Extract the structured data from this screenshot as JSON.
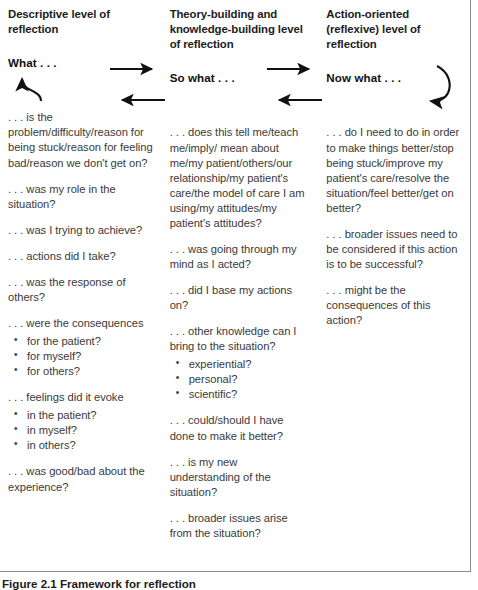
{
  "figure": {
    "caption_number": "Figure 2.1",
    "caption_text": "Framework for reflection",
    "columns": [
      {
        "id": "descriptive",
        "heading": "Descriptive level of reflection",
        "stem": "What . . .",
        "blocks": [
          {
            "type": "para",
            "text": ". . . is the problem/difficulty/reason for being stuck/reason for feeling bad/reason we don't get on?"
          },
          {
            "type": "para",
            "text": ". . . was my role in the situation?"
          },
          {
            "type": "para",
            "text": ". . . was I trying to achieve?"
          },
          {
            "type": "para",
            "text": ". . . actions did I take?"
          },
          {
            "type": "para",
            "text": ". . . was the response of others?"
          },
          {
            "type": "para-tight",
            "text": ". . . were the consequences"
          },
          {
            "type": "bullets",
            "items": [
              "for the patient?",
              "for myself?",
              "for others?"
            ]
          },
          {
            "type": "para-tight",
            "text": ". . . feelings did it evoke"
          },
          {
            "type": "bullets",
            "items": [
              "in the patient?",
              "in myself?",
              "in others?"
            ]
          },
          {
            "type": "para",
            "text": ". . . was good/bad about the experience?"
          }
        ]
      },
      {
        "id": "theory-building",
        "heading": "Theory-building and knowledge-building level of reflection",
        "stem": "So what . . .",
        "blocks": [
          {
            "type": "para",
            "text": ". . . does this tell me/teach me/imply/ mean about me/my patient/others/our relationship/my patient's care/the model of care I am using/my attitudes/my patient's attitudes?"
          },
          {
            "type": "para",
            "text": ". . . was going through my mind as I acted?"
          },
          {
            "type": "para",
            "text": ". . . did I base my actions on?"
          },
          {
            "type": "para-tight",
            "text": ". . . other knowledge can I bring to the situation?"
          },
          {
            "type": "bullets",
            "items": [
              "experiential?",
              "personal?",
              "scientific?"
            ]
          },
          {
            "type": "para",
            "text": ". . . could/should I have done to make it better?"
          },
          {
            "type": "para",
            "text": ". . . is my new understanding of the situation?"
          },
          {
            "type": "para",
            "text": ". . . broader issues arise from the situation?"
          }
        ]
      },
      {
        "id": "action-oriented",
        "heading": "Action-oriented (reflexive) level of reflection",
        "stem": "Now what . . .",
        "blocks": [
          {
            "type": "para",
            "text": ". . . do I need to do in order to make things better/stop being stuck/improve my patient's care/resolve the situation/feel better/get on better?"
          },
          {
            "type": "para",
            "text": ". . . broader issues need to be considered if this action is to be successful?"
          },
          {
            "type": "para",
            "text": ". . . might be the consequences of this action?"
          }
        ]
      }
    ],
    "arrows": [
      {
        "name": "arrow-what-to-sowhat",
        "direction": "right"
      },
      {
        "name": "arrow-sowhat-to-nowwhat",
        "direction": "right"
      },
      {
        "name": "arrow-sowhat-back-to-what",
        "direction": "left"
      },
      {
        "name": "arrow-nowwhat-back-to-sowhat",
        "direction": "left"
      },
      {
        "name": "arrow-curve-into-what",
        "direction": "curve-up-left"
      },
      {
        "name": "arrow-curve-from-nowwhat",
        "direction": "curve-down-right"
      }
    ]
  },
  "colors": {
    "text": "#3a3a3a",
    "heading": "#1c1c1c",
    "border": "#8a8a8a",
    "background": "#ffffff"
  }
}
